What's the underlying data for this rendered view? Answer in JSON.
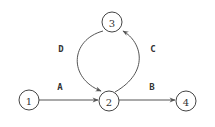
{
  "diagram": {
    "type": "directed-graph",
    "nodes": [
      {
        "id": "1",
        "label": "1"
      },
      {
        "id": "2",
        "label": "2"
      },
      {
        "id": "3",
        "label": "3"
      },
      {
        "id": "4",
        "label": "4"
      }
    ],
    "edges": [
      {
        "id": "A",
        "label": "A",
        "from": "1",
        "to": "2"
      },
      {
        "id": "B",
        "label": "B",
        "from": "2",
        "to": "4"
      },
      {
        "id": "C",
        "label": "C",
        "from": "2",
        "to": "3"
      },
      {
        "id": "D",
        "label": "D",
        "from": "3",
        "to": "2"
      }
    ],
    "colors": {
      "stroke": "#444444",
      "text": "#333333",
      "background": "#ffffff"
    }
  }
}
